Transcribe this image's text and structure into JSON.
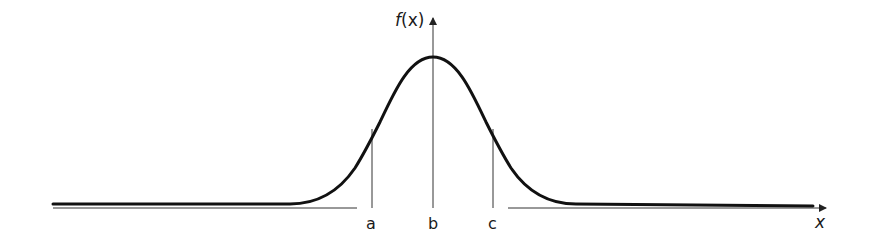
{
  "diagram": {
    "type": "bell-curve",
    "y_axis_label": "f(x)",
    "x_axis_label": "x",
    "markers": [
      {
        "label": "a",
        "x": 372,
        "top": 129
      },
      {
        "label": "b",
        "x": 433,
        "top": 57
      },
      {
        "label": "c",
        "x": 493,
        "top": 129
      }
    ],
    "colors": {
      "curve": "#111111",
      "axis": "#333333",
      "marker": "#333333"
    }
  },
  "labels": {
    "y_axis_f": "f",
    "y_axis_paren": "(x)",
    "x_axis": "x",
    "a": "a",
    "b": "b",
    "c": "c"
  }
}
